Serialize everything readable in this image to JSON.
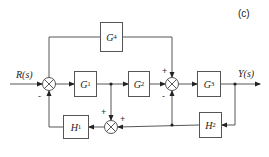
{
  "figure": {
    "panel_label": "(c)",
    "input_label": "R(s)",
    "output_label": "Y(s)",
    "line_color": "#444444"
  },
  "blocks": {
    "G1": {
      "name": "G",
      "sub": "1"
    },
    "G2": {
      "name": "G",
      "sub": "2"
    },
    "G3": {
      "name": "G",
      "sub": "3"
    },
    "G4": {
      "name": "G",
      "sub": "4"
    },
    "H1": {
      "name": "H",
      "sub": "1"
    },
    "H2": {
      "name": "H",
      "sub": "2"
    }
  },
  "summing_junctions": {
    "sum1": {
      "signs": {
        "left": "",
        "top": "",
        "bottom": "-"
      }
    },
    "sum2": {
      "signs": {
        "top": "+",
        "bottom": "-"
      }
    },
    "sum3": {
      "signs": {
        "top": "+",
        "right": "+"
      }
    }
  }
}
